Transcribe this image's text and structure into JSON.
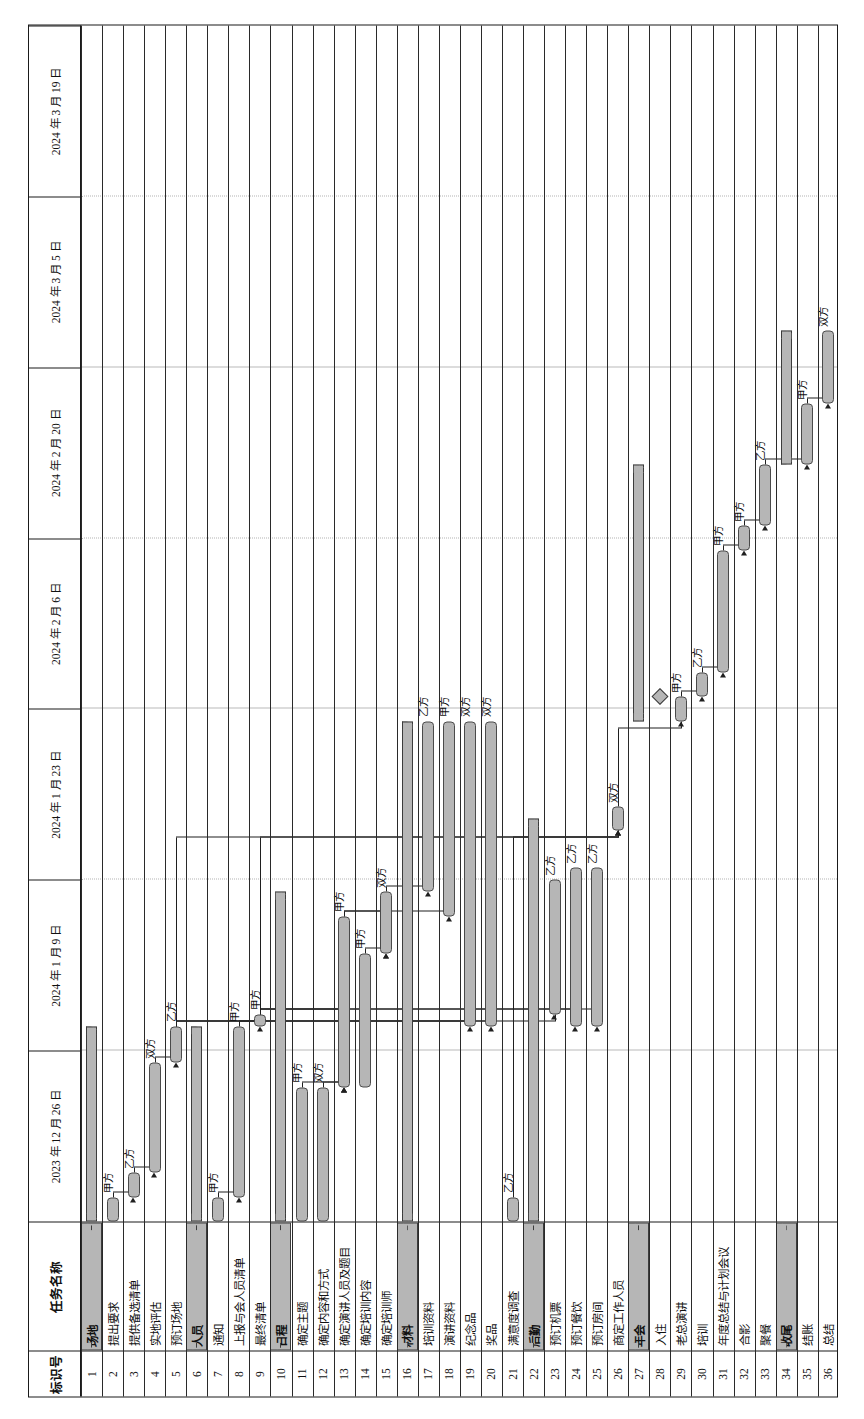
{
  "meta": {
    "orientation": "rotated-90",
    "bar_fill": "#b6b6b6",
    "bar_stroke": "#3c3c3c",
    "grid_color": "#b9b9b9"
  },
  "columns": {
    "id_header": "标识号",
    "name_header": "任务名称"
  },
  "timeline": {
    "ticks": [
      "2023 年 12 月 26 日",
      "2024 年 1 月 9 日",
      "2024 年 1 月 23 日",
      "2024 年 2 月 6 日",
      "2024 年 2 月 20 日",
      "2024 年 3 月 5 日",
      "2024 年 3 月 19 日"
    ],
    "unit_days": 14,
    "start": "2023-12-26",
    "end": "2024-03-19"
  },
  "resource_labels": {
    "a": "甲方",
    "b": "乙方",
    "both": "双方"
  },
  "chart_data": {
    "type": "bar",
    "xlabel": "",
    "ylabel": "",
    "categories": [
      "场地",
      "提出要求",
      "提供备选清单",
      "实地评估",
      "预订场地",
      "人员",
      "通知",
      "上报与会人员清单",
      "最终清单",
      "日程",
      "确定主题",
      "确定内容和方式",
      "确定演讲人员及题目",
      "确定培训内容",
      "确定培训师",
      "材料",
      "培训资料",
      "演讲资料",
      "纪念品",
      "奖品",
      "满意度调查",
      "后勤",
      "预订机票",
      "预订餐饮",
      "预订房间",
      "商定工作人员",
      "年会",
      "入住",
      "老总演讲",
      "培训",
      "年度总结与计划会议",
      "合影",
      "聚餐",
      "收尾",
      "结账",
      "总结"
    ],
    "tasks": [
      {
        "id": 1,
        "name": "场地",
        "type": "summary",
        "start": 0,
        "end": 16,
        "label": ""
      },
      {
        "id": 2,
        "name": "提出要求",
        "type": "task",
        "start": 0,
        "end": 2,
        "label": "甲方"
      },
      {
        "id": 3,
        "name": "提供备选清单",
        "type": "task",
        "start": 2,
        "end": 4,
        "label": "乙方"
      },
      {
        "id": 4,
        "name": "实地评估",
        "type": "task",
        "start": 4,
        "end": 13,
        "label": "双方"
      },
      {
        "id": 5,
        "name": "预订场地",
        "type": "task",
        "start": 13,
        "end": 16,
        "label": "乙方"
      },
      {
        "id": 6,
        "name": "人员",
        "type": "summary",
        "start": 0,
        "end": 16,
        "label": ""
      },
      {
        "id": 7,
        "name": "通知",
        "type": "task",
        "start": 0,
        "end": 2,
        "label": "甲方"
      },
      {
        "id": 8,
        "name": "上报与会人员清单",
        "type": "task",
        "start": 2,
        "end": 16,
        "label": "甲方"
      },
      {
        "id": 9,
        "name": "最终清单",
        "type": "task",
        "start": 16,
        "end": 17,
        "label": "甲方"
      },
      {
        "id": 10,
        "name": "日程",
        "type": "summary",
        "start": 0,
        "end": 27,
        "label": ""
      },
      {
        "id": 11,
        "name": "确定主题",
        "type": "task",
        "start": 0,
        "end": 11,
        "label": "甲方"
      },
      {
        "id": 12,
        "name": "确定内容和方式",
        "type": "task",
        "start": 0,
        "end": 11,
        "label": "双方"
      },
      {
        "id": 13,
        "name": "确定演讲人员及题目",
        "type": "task",
        "start": 11,
        "end": 25,
        "label": "甲方"
      },
      {
        "id": 14,
        "name": "确定培训内容",
        "type": "task",
        "start": 11,
        "end": 22,
        "label": "甲方"
      },
      {
        "id": 15,
        "name": "确定培训师",
        "type": "task",
        "start": 22,
        "end": 27,
        "label": "双方"
      },
      {
        "id": 16,
        "name": "材料",
        "type": "summary",
        "start": 0,
        "end": 41,
        "label": ""
      },
      {
        "id": 17,
        "name": "培训资料",
        "type": "task",
        "start": 27,
        "end": 41,
        "label": "乙方"
      },
      {
        "id": 18,
        "name": "演讲资料",
        "type": "task",
        "start": 25,
        "end": 41,
        "label": "甲方"
      },
      {
        "id": 19,
        "name": "纪念品",
        "type": "task",
        "start": 16,
        "end": 41,
        "label": "双方"
      },
      {
        "id": 20,
        "name": "奖品",
        "type": "task",
        "start": 16,
        "end": 41,
        "label": "双方"
      },
      {
        "id": 21,
        "name": "满意度调查",
        "type": "task",
        "start": 0,
        "end": 2,
        "label": "乙方"
      },
      {
        "id": 22,
        "name": "后勤",
        "type": "summary",
        "start": 0,
        "end": 33,
        "label": ""
      },
      {
        "id": 23,
        "name": "预订机票",
        "type": "task",
        "start": 17,
        "end": 28,
        "label": "乙方"
      },
      {
        "id": 24,
        "name": "预订餐饮",
        "type": "task",
        "start": 16,
        "end": 29,
        "label": "乙方"
      },
      {
        "id": 25,
        "name": "预订房间",
        "type": "task",
        "start": 16,
        "end": 29,
        "label": "乙方"
      },
      {
        "id": 26,
        "name": "商定工作人员",
        "type": "task",
        "start": 32,
        "end": 34,
        "label": "双方"
      },
      {
        "id": 27,
        "name": "年会",
        "type": "summary",
        "start": 41,
        "end": 62,
        "label": ""
      },
      {
        "id": 28,
        "name": "入住",
        "type": "milestone",
        "start": 43,
        "end": 43,
        "label": ""
      },
      {
        "id": 29,
        "name": "老总演讲",
        "type": "task",
        "start": 41,
        "end": 43,
        "label": "甲方"
      },
      {
        "id": 30,
        "name": "培训",
        "type": "task",
        "start": 43,
        "end": 45,
        "label": "乙方"
      },
      {
        "id": 31,
        "name": "年度总结与计划会议",
        "type": "task",
        "start": 45,
        "end": 55,
        "label": "甲方"
      },
      {
        "id": 32,
        "name": "合影",
        "type": "task",
        "start": 55,
        "end": 57,
        "label": "甲方"
      },
      {
        "id": 33,
        "name": "聚餐",
        "type": "task",
        "start": 57,
        "end": 62,
        "label": "乙方"
      },
      {
        "id": 34,
        "name": "收尾",
        "type": "summary",
        "start": 62,
        "end": 73,
        "label": ""
      },
      {
        "id": 35,
        "name": "结账",
        "type": "task",
        "start": 62,
        "end": 67,
        "label": "甲方"
      },
      {
        "id": 36,
        "name": "总结",
        "type": "task",
        "start": 67,
        "end": 73,
        "label": "双方"
      }
    ]
  }
}
